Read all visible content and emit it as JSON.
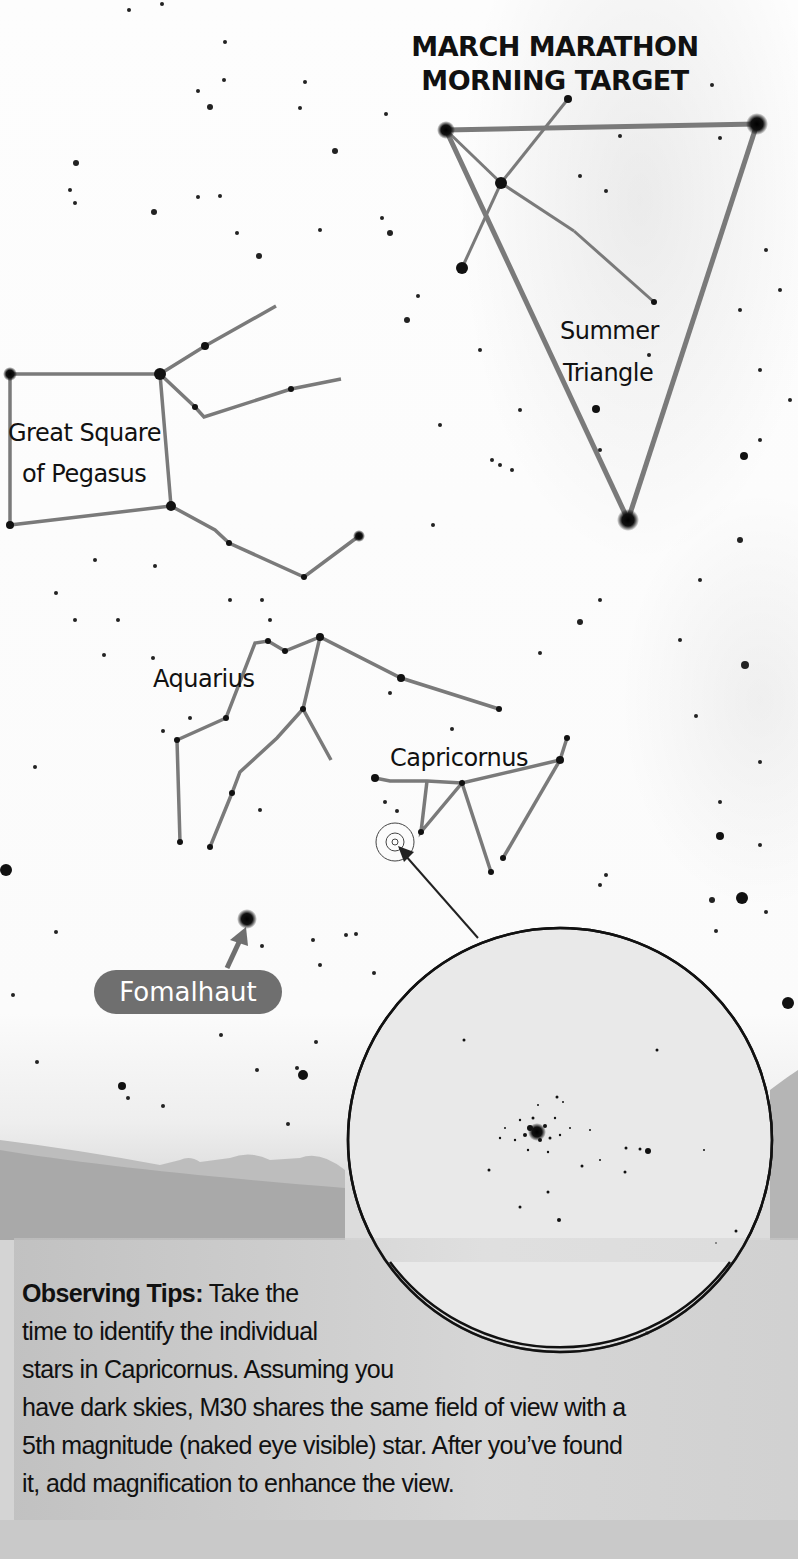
{
  "title": {
    "line1": "MARCH MARATHON",
    "line2": "MORNING TARGET"
  },
  "labels": {
    "summer_triangle_1": "Summer",
    "summer_triangle_2": "Triangle",
    "pegasus_1": "Great Square",
    "pegasus_2": "of Pegasus",
    "aquarius": "Aquarius",
    "capricornus": "Capricornus",
    "fomalhaut": "Fomalhaut"
  },
  "tips": {
    "heading": "Observing Tips:",
    "line1": "Take the",
    "line2": "time to identify the individual",
    "line3": "stars in Capricornus. Assuming you",
    "line4": "have dark skies, M30 shares the same field of view with a",
    "line5": "5th magnitude (naked eye visible) star. After you’ve found",
    "line6": "it, add magnification to enhance the view."
  },
  "colors": {
    "line": "#7a7a7a",
    "star": "#111111",
    "label_bg": "#6f6f6f"
  }
}
